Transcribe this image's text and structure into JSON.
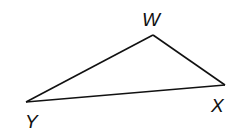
{
  "diagram": {
    "type": "triangle",
    "name": "Triangle WXY",
    "stroke_color": "#111111",
    "background": "#ffffff",
    "vertices": [
      {
        "id": "W",
        "label": "W",
        "x": 153,
        "y": 35,
        "label_x": 142,
        "label_y": 26
      },
      {
        "id": "X",
        "label": "X",
        "x": 225,
        "y": 85,
        "label_x": 211,
        "label_y": 112
      },
      {
        "id": "Y",
        "label": "Y",
        "x": 26,
        "y": 102,
        "label_x": 25,
        "label_y": 128
      }
    ],
    "edges": [
      {
        "from": "W",
        "to": "X",
        "name": "WX"
      },
      {
        "from": "X",
        "to": "Y",
        "name": "XY"
      },
      {
        "from": "Y",
        "to": "W",
        "name": "YW"
      }
    ]
  }
}
